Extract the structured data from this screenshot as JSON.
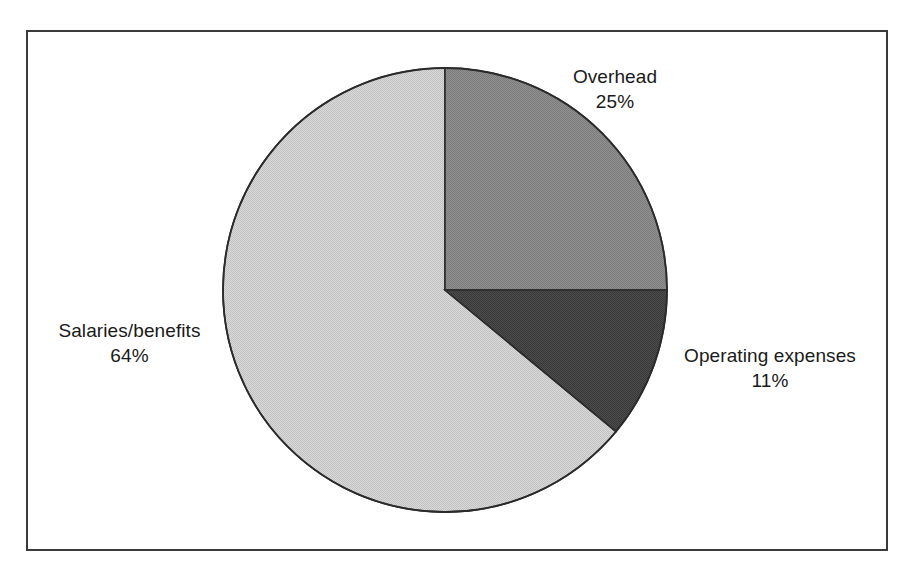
{
  "chart_data": {
    "type": "pie",
    "title": "",
    "subtitle": "",
    "xlabel": "",
    "ylabel": "",
    "legend_position": "none",
    "grid": false,
    "start_angle_deg": 0,
    "direction": "clockwise",
    "categories": [
      "Overhead",
      "Operating expenses",
      "Salaries/benefits"
    ],
    "values": [
      25,
      11,
      64
    ],
    "value_unit": "%",
    "slices": [
      {
        "label": "Overhead",
        "value": 25,
        "value_text": "25%",
        "color": "#8a8a8a",
        "start_deg": 0,
        "end_deg": 90
      },
      {
        "label": "Operating expenses",
        "value": 11,
        "value_text": "11%",
        "color": "#454545",
        "start_deg": 90,
        "end_deg": 129.6
      },
      {
        "label": "Salaries/benefits",
        "value": 64,
        "value_text": "64%",
        "color": "#d0d0d0",
        "start_deg": 129.6,
        "end_deg": 360
      }
    ]
  },
  "figure": {
    "border_color": "#3a3a3a",
    "background_color": "#ffffff",
    "slice_outline_color": "#2b2b2b"
  },
  "labels": {
    "overhead": {
      "name": "Overhead",
      "value": "25%"
    },
    "operating": {
      "name": "Operating expenses",
      "value": "11%"
    },
    "salaries": {
      "name": "Salaries/benefits",
      "value": "64%"
    }
  }
}
